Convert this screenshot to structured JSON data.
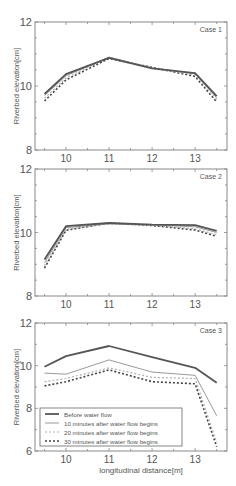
{
  "figure": {
    "background": "#ffffff",
    "axis_color": "#888888"
  },
  "chart_data": [
    {
      "type": "line",
      "title": "Case 1",
      "xlabel": "",
      "ylabel": "Riverbed elevation[cm]",
      "xlim": [
        9.28,
        13.74
      ],
      "ylim": [
        8,
        12
      ],
      "xticks": [
        10,
        11,
        12,
        13
      ],
      "yticks": [
        8,
        10,
        12
      ],
      "grid": false,
      "legend": null,
      "x": [
        9.5,
        10,
        11,
        12,
        13,
        13.5
      ],
      "series": [
        {
          "name": "Before water flow",
          "values": [
            9.75,
            10.37,
            10.88,
            10.55,
            10.4,
            9.68
          ]
        },
        {
          "name": "10 minutes after water flow begins",
          "values": [
            9.7,
            10.32,
            10.9,
            10.57,
            10.38,
            9.63
          ]
        },
        {
          "name": "20 minutes after water flow begins",
          "values": [
            9.62,
            10.25,
            10.9,
            10.55,
            10.35,
            9.58
          ]
        },
        {
          "name": "30 minutes after water flow begins",
          "values": [
            9.53,
            10.19,
            10.86,
            10.58,
            10.3,
            9.5
          ]
        }
      ]
    },
    {
      "type": "line",
      "title": "Case 2",
      "xlabel": "",
      "ylabel": "Riverbed elevation[cm]",
      "xlim": [
        9.28,
        13.74
      ],
      "ylim": [
        8,
        12
      ],
      "xticks": [
        10,
        11,
        12,
        13
      ],
      "yticks": [
        8,
        10,
        12
      ],
      "grid": false,
      "legend": null,
      "x": [
        9.5,
        10,
        11,
        12,
        13,
        13.5
      ],
      "series": [
        {
          "name": "Before water flow",
          "values": [
            9.15,
            10.2,
            10.3,
            10.25,
            10.23,
            10.05
          ]
        },
        {
          "name": "10 minutes after water flow begins",
          "values": [
            9.05,
            10.15,
            10.28,
            10.24,
            10.18,
            10.0
          ]
        },
        {
          "name": "20 minutes after water flow begins",
          "values": [
            8.95,
            10.1,
            10.27,
            10.22,
            10.12,
            9.93
          ]
        },
        {
          "name": "30 minutes after water flow begins",
          "values": [
            8.88,
            10.07,
            10.3,
            10.22,
            10.08,
            9.88
          ]
        }
      ]
    },
    {
      "type": "line",
      "title": "Case 3",
      "xlabel": "longitudinal distance[m]",
      "ylabel": "Riverbed elevation[cm]",
      "xlim": [
        9.28,
        13.74
      ],
      "ylim": [
        6,
        12
      ],
      "xticks": [
        10,
        11,
        12,
        13
      ],
      "yticks": [
        6,
        8,
        10,
        12
      ],
      "grid": false,
      "legend": "lower left",
      "x": [
        9.5,
        10,
        11,
        12,
        13,
        13.5
      ],
      "series": [
        {
          "name": "Before water flow",
          "values": [
            9.95,
            10.45,
            10.92,
            10.4,
            9.9,
            9.2
          ]
        },
        {
          "name": "10 minutes after water flow begins",
          "values": [
            9.65,
            9.6,
            10.27,
            9.7,
            9.55,
            7.65
          ]
        },
        {
          "name": "20 minutes after water flow begins",
          "values": [
            9.25,
            9.4,
            9.9,
            9.45,
            9.4,
            6.4
          ]
        },
        {
          "name": "30 minutes after water flow begins",
          "values": [
            9.05,
            9.25,
            9.8,
            9.25,
            9.15,
            6.2
          ]
        }
      ]
    }
  ],
  "legend": {
    "entries": [
      {
        "label": "Before water flow",
        "style": "solid-thick",
        "color": "#555555"
      },
      {
        "label": "10 minutes after water flow begins",
        "style": "solid-thin",
        "color": "#999999"
      },
      {
        "label": "20 minutes after water flow begins",
        "style": "dashed-light",
        "color": "#aaaaaa"
      },
      {
        "label": "30 minutes after water flow begins",
        "style": "dashed-dark",
        "color": "#444444"
      }
    ]
  },
  "layout": {
    "panels": [
      {
        "left": 35,
        "right": 227,
        "top": 22,
        "bottom": 150
      },
      {
        "left": 35,
        "right": 227,
        "top": 169,
        "bottom": 296
      },
      {
        "left": 35,
        "right": 227,
        "top": 323,
        "bottom": 451
      }
    ]
  }
}
